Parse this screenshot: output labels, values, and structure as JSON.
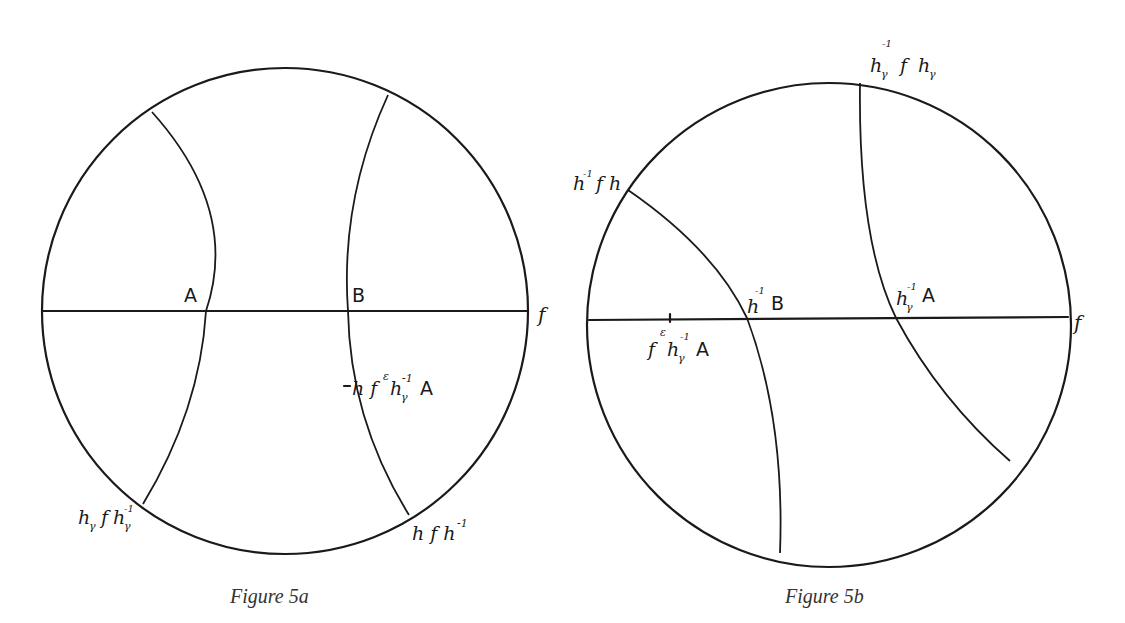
{
  "figures": [
    {
      "id": "5a",
      "caption": "Figure 5a",
      "points": {
        "A": "A",
        "B": "B"
      },
      "labels": {
        "end_f": "f",
        "bottom_left": "h",
        "bottom_left_sub": "γ",
        "bottom_left_mid": "f",
        "bottom_left_inv": "h",
        "bottom_left_inv_sub": "γ",
        "bottom_left_inv_sup": "-1",
        "bottom_right": "h f h",
        "bottom_right_sup": "-1",
        "mark": "h f",
        "mark_sup_eps": "ε",
        "mark_h": "h",
        "mark_h_sub": "γ",
        "mark_h_sup": "-1",
        "mark_A": "A"
      }
    },
    {
      "id": "5b",
      "caption": "Figure 5b",
      "labels": {
        "end_f": "f",
        "top_left_h": "h",
        "top_left_sup": "-1",
        "top_left_rest": "f h",
        "top_h": "h",
        "top_h_sub": "γ",
        "top_h_sup": "-1",
        "top_mid": "f",
        "top_h2": "h",
        "top_h2_sub": "γ",
        "pt1_h": "h",
        "pt1_sup": "-1",
        "pt1_B": "B",
        "pt2_h": "h",
        "pt2_sub": "γ",
        "pt2_sup": "-1",
        "pt2_A": "A",
        "mark_f": "f",
        "mark_sup_eps": "ε",
        "mark_h": "h",
        "mark_h_sub": "γ",
        "mark_h_sup": "-1",
        "mark_A": "A"
      }
    }
  ]
}
